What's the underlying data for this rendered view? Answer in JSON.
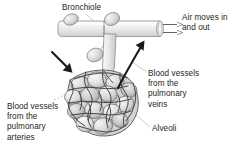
{
  "figure": {
    "background_color": "#ffffff",
    "ink_color": "#231f20",
    "tube_fill_light": "#f2f2f2",
    "tube_fill_mid": "#dcdcdc",
    "tube_stroke": "#7d7d7d",
    "alveoli_fill_light": "#e8e8e8",
    "alveoli_fill_mid": "#c9c9c9",
    "alveoli_fill_dark": "#a9a9a9",
    "vessel_stroke": "#4a4a4a",
    "leader_stroke": "#b5b5b5",
    "arrow_color": "#1a1a1a"
  },
  "labels": {
    "bronchiole": "Bronchiole",
    "air_moves": "Air moves in\nand out",
    "pulmonary_veins": "Blood vessels\nfrom the\npulmonary\nveins",
    "pulmonary_arteries": "Blood vessels\nfrom the\npulmonary\narteries",
    "alveoli": "Alveoli"
  },
  "annotations": {
    "air_flow_arrows": 2,
    "deoxygenated_blood_arrow": "arrow pointing into alveoli cluster from upper left",
    "oxygenated_blood_arrow": "curved arrow pointing out of alveoli cluster to upper right"
  }
}
